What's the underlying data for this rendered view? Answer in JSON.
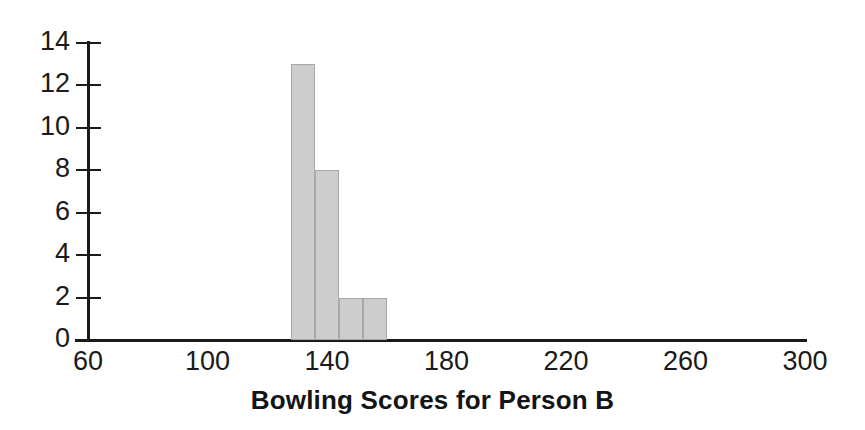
{
  "chart_data": {
    "type": "bar",
    "title": "Bowling Scores for Person B",
    "xlabel": "Bowling Scores for Person B",
    "ylabel": "",
    "xlim": [
      60,
      300
    ],
    "ylim": [
      0,
      14
    ],
    "grid": false,
    "legend": null,
    "bin_width": 8,
    "x_ticks": [
      {
        "value": 60,
        "label": "60"
      },
      {
        "value": 100,
        "label": "100"
      },
      {
        "value": 140,
        "label": "140"
      },
      {
        "value": 180,
        "label": "180"
      },
      {
        "value": 220,
        "label": "220"
      },
      {
        "value": 260,
        "label": "260"
      },
      {
        "value": 300,
        "label": "300"
      }
    ],
    "y_ticks": [
      {
        "value": 0,
        "label": "0"
      },
      {
        "value": 2,
        "label": "2"
      },
      {
        "value": 4,
        "label": "4"
      },
      {
        "value": 6,
        "label": "6"
      },
      {
        "value": 8,
        "label": "8"
      },
      {
        "value": 10,
        "label": "10"
      },
      {
        "value": 12,
        "label": "12"
      },
      {
        "value": 14,
        "label": "14"
      }
    ],
    "bars": [
      {
        "bin_start": 128,
        "bin_end": 136,
        "value": 13
      },
      {
        "bin_start": 136,
        "bin_end": 144,
        "value": 8
      },
      {
        "bin_start": 144,
        "bin_end": 152,
        "value": 2
      },
      {
        "bin_start": 152,
        "bin_end": 160,
        "value": 2
      }
    ],
    "categories": [
      "128-136",
      "136-144",
      "144-152",
      "152-160"
    ],
    "values": [
      13,
      8,
      2,
      2
    ],
    "colors": {
      "bar_fill": "#cdcdcd",
      "bar_stroke": "#a8a8a8",
      "axis": "#1a1a1a",
      "text": "#1a1a1a",
      "background": "#ffffff"
    }
  }
}
